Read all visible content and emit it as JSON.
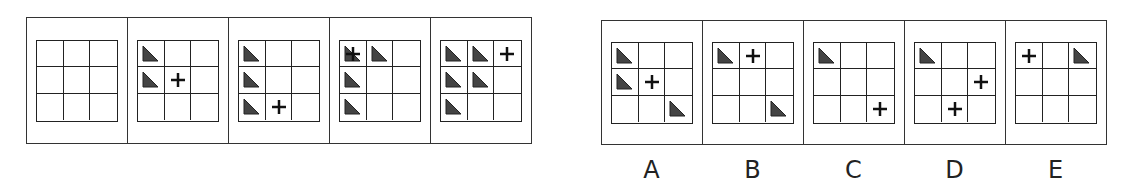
{
  "puzzle": {
    "type": "matrix-sequence-reasoning",
    "grid_size": [
      3,
      3
    ],
    "symbols": {
      "triangle": {
        "icon": "right-triangle-icon",
        "color": "#444444"
      },
      "plus": {
        "icon": "plus-icon",
        "color": "#111111"
      }
    },
    "question_panels": [
      {
        "triangles": [],
        "plus": []
      },
      {
        "triangles": [
          [
            0,
            0
          ],
          [
            1,
            0
          ]
        ],
        "plus": [
          [
            1,
            1
          ]
        ]
      },
      {
        "triangles": [
          [
            0,
            0
          ],
          [
            1,
            0
          ],
          [
            2,
            0
          ]
        ],
        "plus": [
          [
            2,
            1
          ]
        ]
      },
      {
        "triangles": [
          [
            0,
            0
          ],
          [
            0,
            1
          ],
          [
            1,
            0
          ],
          [
            2,
            0
          ]
        ],
        "plus": [
          [
            0,
            0
          ]
        ]
      },
      {
        "triangles": [
          [
            0,
            0
          ],
          [
            0,
            1
          ],
          [
            1,
            0
          ],
          [
            1,
            1
          ],
          [
            2,
            0
          ]
        ],
        "plus": [
          [
            0,
            2
          ]
        ]
      }
    ],
    "answer_panels": [
      {
        "label": "A",
        "triangles": [
          [
            0,
            0
          ],
          [
            1,
            0
          ],
          [
            2,
            2
          ]
        ],
        "plus": [
          [
            1,
            1
          ]
        ]
      },
      {
        "label": "B",
        "triangles": [
          [
            0,
            0
          ],
          [
            2,
            2
          ]
        ],
        "plus": [
          [
            0,
            1
          ]
        ]
      },
      {
        "label": "C",
        "triangles": [
          [
            0,
            0
          ]
        ],
        "plus": [
          [
            2,
            2
          ]
        ]
      },
      {
        "label": "D",
        "triangles": [
          [
            0,
            0
          ]
        ],
        "plus": [
          [
            1,
            2
          ],
          [
            2,
            1
          ]
        ]
      },
      {
        "label": "E",
        "triangles": [
          [
            0,
            2
          ]
        ],
        "plus": [
          [
            0,
            0
          ]
        ]
      }
    ]
  },
  "labels": {
    "a": "A",
    "b": "B",
    "c": "C",
    "d": "D",
    "e": "E"
  }
}
